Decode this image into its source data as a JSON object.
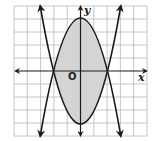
{
  "figure": {
    "type": "coordinate-graph",
    "x_axis_label": "x",
    "y_axis_label": "y",
    "origin_label": "O",
    "grid": {
      "cells_x": 10,
      "cells_y": 10,
      "x_range": [
        -5,
        5
      ],
      "y_range": [
        -5,
        5
      ]
    },
    "curves": [
      {
        "name": "upper-opening-parabola",
        "equation": "y = x^2 - 4",
        "vertex": [
          0,
          -4
        ],
        "x_intercepts": [
          -2,
          2
        ]
      },
      {
        "name": "downward-opening-parabola",
        "equation": "y = 4 - x^2",
        "vertex": [
          0,
          4
        ],
        "x_intercepts": [
          -2,
          2
        ]
      }
    ],
    "shaded_region": "between the parabolas for -2 <= x <= 2",
    "colors": {
      "grid": "#b8b8b8",
      "curve": "#1a1a1a",
      "shade": "#d4d4d4",
      "axis": "#1a1a1a"
    }
  }
}
